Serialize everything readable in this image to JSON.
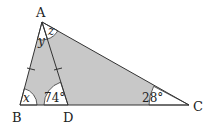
{
  "diagram": {
    "type": "triangle",
    "colors": {
      "shade": "#c8c8c8",
      "stroke": "#333333",
      "arc_fill": "#ffffff"
    },
    "vertices": {
      "A": {
        "label": "A"
      },
      "B": {
        "label": "B"
      },
      "C": {
        "label": "C"
      },
      "D": {
        "label": "D"
      }
    },
    "angles": {
      "x": "x",
      "y": "y",
      "z": "z",
      "ADB": "74°",
      "C": "28°"
    },
    "tick_marks": "AB = AD (equal sides marked)"
  }
}
